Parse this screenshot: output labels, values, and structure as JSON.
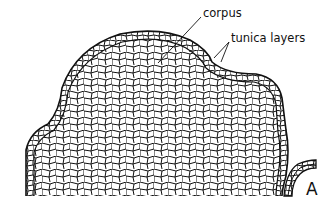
{
  "figure": {
    "panel_label": "A",
    "annotations": [
      {
        "id": "corpus",
        "text": "corpus"
      },
      {
        "id": "tunica",
        "text": "tunica layers"
      }
    ],
    "colors": {
      "ink": "#111111",
      "background": "#ffffff"
    }
  }
}
